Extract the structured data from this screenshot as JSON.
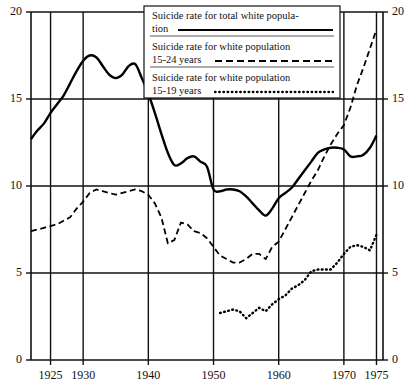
{
  "chart_data": {
    "type": "line",
    "title": "",
    "xlabel": "",
    "ylabel": "",
    "xlim": [
      1922,
      1976
    ],
    "ylim": [
      0,
      20
    ],
    "grid": true,
    "legend_position": "top-center",
    "y_ticks": [
      "0",
      "5",
      "10",
      "15",
      "20"
    ],
    "y_tick_values": [
      0,
      5,
      10,
      15,
      20
    ],
    "x_ticks": [
      "1925",
      "1930",
      "1940",
      "1950",
      "1960",
      "1970",
      "1975"
    ],
    "x_tick_values": [
      1925,
      1930,
      1940,
      1950,
      1960,
      1970,
      1975
    ],
    "x_gridlines": [
      1925,
      1930,
      1940,
      1950,
      1960,
      1970,
      1975
    ],
    "y_gridlines": [
      5,
      10,
      15
    ],
    "series": [
      {
        "name": "Suicide rate for total white population",
        "style": "solid",
        "color": "#000000",
        "x": [
          1922,
          1923,
          1924,
          1925,
          1926,
          1927,
          1928,
          1929,
          1930,
          1931,
          1932,
          1933,
          1934,
          1935,
          1936,
          1937,
          1938,
          1939,
          1940,
          1941,
          1942,
          1943,
          1944,
          1945,
          1946,
          1947,
          1948,
          1949,
          1950,
          1951,
          1952,
          1953,
          1954,
          1955,
          1956,
          1957,
          1958,
          1959,
          1960,
          1961,
          1962,
          1963,
          1964,
          1965,
          1966,
          1967,
          1968,
          1969,
          1970,
          1971,
          1972,
          1973,
          1974,
          1975
        ],
        "y": [
          12.7,
          13.2,
          13.6,
          14.2,
          14.7,
          15.2,
          15.9,
          16.6,
          17.2,
          17.5,
          17.4,
          16.9,
          16.4,
          16.2,
          16.4,
          16.9,
          17.0,
          16.2,
          15.3,
          14.2,
          13.0,
          11.9,
          11.2,
          11.3,
          11.6,
          11.7,
          11.4,
          11.1,
          9.8,
          9.7,
          9.8,
          9.8,
          9.7,
          9.4,
          9.0,
          8.6,
          8.3,
          8.7,
          9.3,
          9.6,
          9.9,
          10.4,
          10.9,
          11.4,
          11.9,
          12.1,
          12.2,
          12.2,
          12.1,
          11.7,
          11.7,
          11.8,
          12.2,
          12.9
        ]
      },
      {
        "name": "Suicide rate for white population 15-24 years",
        "style": "dashed",
        "color": "#000000",
        "x": [
          1922,
          1923,
          1924,
          1925,
          1926,
          1927,
          1928,
          1929,
          1930,
          1931,
          1932,
          1933,
          1934,
          1935,
          1936,
          1937,
          1938,
          1939,
          1940,
          1941,
          1942,
          1943,
          1944,
          1945,
          1946,
          1947,
          1948,
          1949,
          1950,
          1951,
          1952,
          1953,
          1954,
          1955,
          1956,
          1957,
          1958,
          1959,
          1960,
          1961,
          1962,
          1963,
          1964,
          1965,
          1966,
          1967,
          1968,
          1969,
          1970,
          1971,
          1972,
          1973,
          1974,
          1975
        ],
        "y": [
          7.4,
          7.5,
          7.6,
          7.7,
          7.8,
          8.0,
          8.2,
          8.7,
          9.1,
          9.6,
          9.8,
          9.7,
          9.6,
          9.5,
          9.6,
          9.7,
          9.8,
          9.7,
          9.5,
          9.0,
          8.2,
          6.7,
          6.9,
          7.9,
          7.8,
          7.4,
          7.3,
          7.0,
          6.5,
          6.0,
          5.8,
          5.6,
          5.6,
          5.8,
          6.1,
          6.1,
          5.8,
          6.5,
          6.8,
          7.5,
          8.2,
          8.9,
          9.6,
          10.3,
          10.9,
          11.7,
          12.4,
          13.0,
          13.5,
          14.5,
          15.8,
          16.8,
          17.9,
          19.0
        ]
      },
      {
        "name": "Suicide rate for white population 15-19 years",
        "style": "dotted",
        "color": "#000000",
        "x": [
          1951,
          1952,
          1953,
          1954,
          1955,
          1956,
          1957,
          1958,
          1959,
          1960,
          1961,
          1962,
          1963,
          1964,
          1965,
          1966,
          1967,
          1968,
          1969,
          1970,
          1971,
          1972,
          1973,
          1974,
          1975
        ],
        "y": [
          2.7,
          2.8,
          2.9,
          2.8,
          2.4,
          2.7,
          3.0,
          2.8,
          3.2,
          3.5,
          3.7,
          4.1,
          4.3,
          4.6,
          5.1,
          5.2,
          5.2,
          5.2,
          5.6,
          6.1,
          6.5,
          6.6,
          6.5,
          6.3,
          7.2
        ]
      }
    ]
  },
  "legend": {
    "items": [
      {
        "line1": "Suicide rate for total white popula-",
        "line2": "tion",
        "style": "solid"
      },
      {
        "line1": "Suicide rate for white population",
        "line2": "15-24 years",
        "style": "dashed"
      },
      {
        "line1": "Suicide rate for white population",
        "line2": "15-19 years",
        "style": "dotted"
      }
    ]
  },
  "axes": {
    "y_left_labels": [
      "20",
      "15",
      "10",
      "5",
      "0"
    ],
    "y_right_labels": [
      "20",
      "15",
      "10",
      "5",
      "0"
    ],
    "x_labels": [
      "1925",
      "1930",
      "1940",
      "1950",
      "1960",
      "1970",
      "1975"
    ]
  }
}
